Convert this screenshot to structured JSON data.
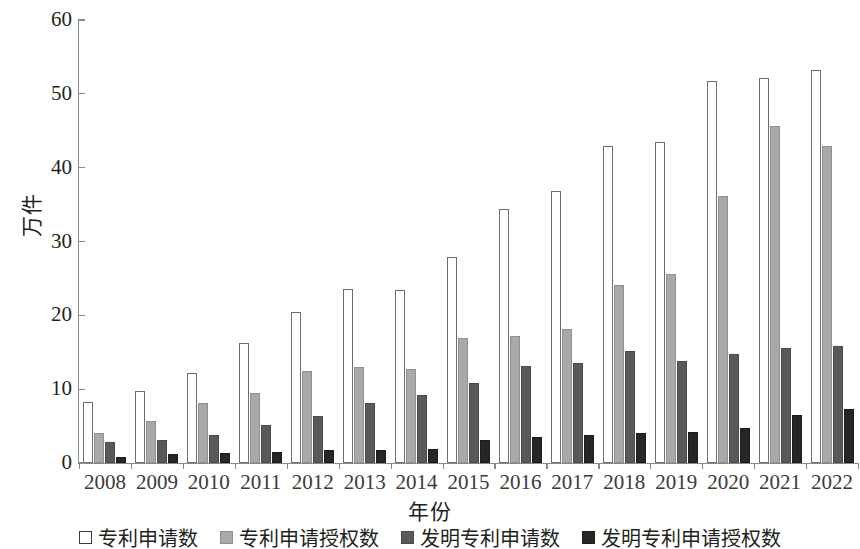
{
  "chart_data": {
    "type": "bar",
    "title": "",
    "xlabel": "年份",
    "ylabel": "万件",
    "ylim": [
      0,
      60
    ],
    "yticks": [
      0,
      10,
      20,
      30,
      40,
      50,
      60
    ],
    "grid": false,
    "legend_position": "bottom",
    "categories": [
      "2008",
      "2009",
      "2010",
      "2011",
      "2012",
      "2013",
      "2014",
      "2015",
      "2016",
      "2017",
      "2018",
      "2019",
      "2020",
      "2021",
      "2022"
    ],
    "series": [
      {
        "name": "专利申请数",
        "color": "#ffffff",
        "values": [
          8.3,
          9.8,
          12.2,
          16.3,
          20.5,
          23.6,
          23.4,
          27.9,
          34.4,
          36.8,
          43.0,
          43.5,
          51.8,
          52.2,
          53.2
        ]
      },
      {
        "name": "专利申请授权数",
        "color": "#a9a9a9",
        "values": [
          4.0,
          5.7,
          8.1,
          9.5,
          12.4,
          13.0,
          12.8,
          16.9,
          17.2,
          18.2,
          24.1,
          25.6,
          36.1,
          45.6,
          42.9
        ]
      },
      {
        "name": "发明专利申请数",
        "color": "#595959",
        "values": [
          2.9,
          3.1,
          3.8,
          5.1,
          6.4,
          8.1,
          9.2,
          10.9,
          13.2,
          13.6,
          15.2,
          13.8,
          14.7,
          15.6,
          15.9
        ]
      },
      {
        "name": "发明专利申请授权数",
        "color": "#262626",
        "values": [
          0.8,
          1.2,
          1.3,
          1.5,
          1.8,
          1.7,
          1.9,
          3.1,
          3.5,
          3.8,
          4.0,
          4.2,
          4.8,
          6.5,
          7.3
        ]
      }
    ]
  },
  "axis": {
    "y_title": "万件",
    "x_title": "年份"
  }
}
